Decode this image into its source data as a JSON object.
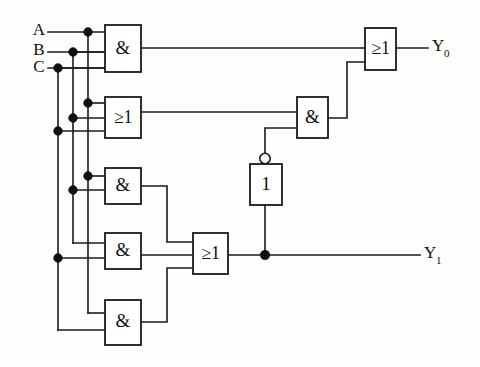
{
  "diagram": {
    "background_color": "#fdfdfc",
    "line_color": "#1a1a1a",
    "inputs": [
      {
        "id": "A",
        "label": "A",
        "bus_x": 88,
        "row_y": 32
      },
      {
        "id": "B",
        "label": "B",
        "bus_x": 73,
        "row_y": 52
      },
      {
        "id": "C",
        "label": "C",
        "bus_x": 58,
        "row_y": 68
      }
    ],
    "outputs": [
      {
        "id": "Y0",
        "label": "Y",
        "subscript": "0",
        "y": 48
      },
      {
        "id": "Y1",
        "label": "Y",
        "subscript": "1",
        "y": 255
      }
    ],
    "gates": [
      {
        "id": "g1",
        "symbol": "&",
        "type": "and",
        "inputs": [
          "A",
          "B",
          "C"
        ],
        "x": 105,
        "y": 25,
        "w": 36,
        "h": 47
      },
      {
        "id": "g2",
        "symbol": "≥1",
        "type": "or",
        "inputs": [
          "A",
          "B",
          "C"
        ],
        "x": 105,
        "y": 97,
        "w": 36,
        "h": 41
      },
      {
        "id": "g3",
        "symbol": "&",
        "type": "and",
        "inputs": [
          "A",
          "B"
        ],
        "x": 105,
        "y": 168,
        "w": 36,
        "h": 36
      },
      {
        "id": "g4",
        "symbol": "&",
        "type": "and",
        "inputs": [
          "B",
          "C"
        ],
        "x": 105,
        "y": 233,
        "w": 36,
        "h": 36
      },
      {
        "id": "g5",
        "symbol": "&",
        "type": "and",
        "inputs": [
          "A",
          "C"
        ],
        "x": 105,
        "y": 300,
        "w": 36,
        "h": 45
      },
      {
        "id": "g6",
        "symbol": "≥1",
        "type": "or",
        "inputs": [
          "g3",
          "g4",
          "g5"
        ],
        "x": 193,
        "y": 233,
        "w": 35,
        "h": 41
      },
      {
        "id": "g7",
        "symbol": "1",
        "type": "not",
        "inputs": [
          "g6"
        ],
        "x": 250,
        "y": 164,
        "w": 32,
        "h": 41,
        "orientation": "vertical",
        "bubble": "top"
      },
      {
        "id": "g8",
        "symbol": "&",
        "type": "and",
        "inputs": [
          "g2",
          "g7"
        ],
        "x": 297,
        "y": 97,
        "w": 31,
        "h": 41
      },
      {
        "id": "g9",
        "symbol": "≥1",
        "type": "or",
        "inputs": [
          "g1",
          "g8"
        ],
        "x": 365,
        "y": 28,
        "w": 31,
        "h": 42
      }
    ],
    "junction_dots": [
      {
        "x": 88,
        "y": 32
      },
      {
        "x": 73,
        "y": 52
      },
      {
        "x": 58,
        "y": 68
      },
      {
        "x": 88,
        "y": 103
      },
      {
        "x": 73,
        "y": 118
      },
      {
        "x": 58,
        "y": 131
      },
      {
        "x": 88,
        "y": 176
      },
      {
        "x": 73,
        "y": 190
      },
      {
        "x": 58,
        "y": 258
      },
      {
        "x": 265,
        "y": 255
      }
    ]
  }
}
